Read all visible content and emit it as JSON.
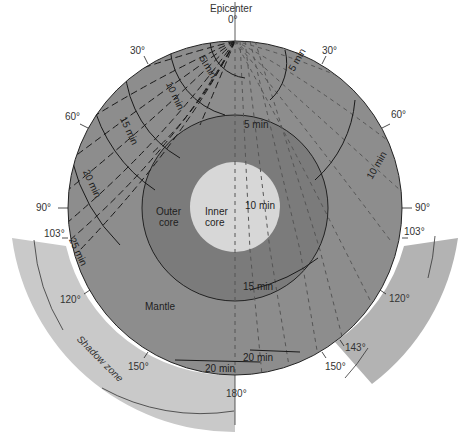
{
  "colors": {
    "background": "#ffffff",
    "mantle": "#8c8c8c",
    "outer_core": "#7a7a7a",
    "inner_core": "#d6d6d6",
    "shadow_zone": "#c8c8c8",
    "lines": "#1a1a1a"
  },
  "epicenter": {
    "label": "Epicenter",
    "angle_label": "0°"
  },
  "layers": {
    "mantle": "Mantle",
    "outer_core": [
      "Outer",
      "core"
    ],
    "inner_core": [
      "Inner",
      "core"
    ]
  },
  "angle_marks": {
    "left": [
      "30°",
      "60°",
      "90°",
      "103°",
      "120°",
      "150°"
    ],
    "right": [
      "30°",
      "60°",
      "90°",
      "103°",
      "120°",
      "143°",
      "150°"
    ],
    "bottom": "180°"
  },
  "time_labels": {
    "left_wavefronts": [
      "5 min",
      "10 min",
      "15 min",
      "20 min",
      "25 min"
    ],
    "right_wavefronts": [
      "5 min",
      "10 min"
    ],
    "core_wavefronts": [
      "5 min",
      "10 min",
      "15 min",
      "20 min",
      "20 min"
    ]
  },
  "shadow_zone": {
    "label": "Shadow zone",
    "left_range": [
      "103°",
      "180°"
    ],
    "right_range": [
      "103°",
      "143°"
    ]
  }
}
